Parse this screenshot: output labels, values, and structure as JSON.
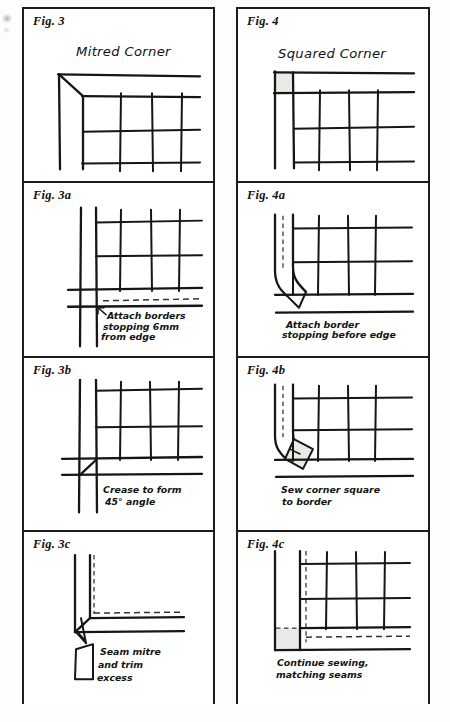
{
  "document": {
    "kind": "instructional-diagram-sheet",
    "subject": "Quilt border corner construction",
    "columns": 2,
    "panel_count": 8
  },
  "panels": [
    {
      "id": "fig-3",
      "figure_label": "Fig. 3",
      "heading": "Mitred Corner",
      "caption": "",
      "caption_lines": [],
      "column": "left",
      "row": 1,
      "has_grey_fill": false,
      "has_dashed_line": false,
      "description": "Border strips meeting at a 45 degree mitre seam with quilt grid"
    },
    {
      "id": "fig-4",
      "figure_label": "Fig. 4",
      "heading": "Squared Corner",
      "caption": "",
      "caption_lines": [],
      "column": "right",
      "row": 1,
      "has_grey_fill": true,
      "has_dashed_line": false,
      "description": "Border strips meeting at a square corner block with quilt grid"
    },
    {
      "id": "fig-3a",
      "figure_label": "Fig. 3a",
      "heading": "",
      "caption": "Attach borders stopping 6mm from edge",
      "caption_lines": [
        "Attach borders",
        "stopping 6mm",
        "from edge"
      ],
      "column": "left",
      "row": 2,
      "has_grey_fill": false,
      "has_dashed_line": true,
      "description": "Arrow points to stitch stop point 6mm in from the raw edge"
    },
    {
      "id": "fig-4a",
      "figure_label": "Fig. 4a",
      "heading": "",
      "caption": "Attach border stopping before edge",
      "caption_lines": [
        "Attach border",
        "stopping before edge"
      ],
      "column": "right",
      "row": 2,
      "has_grey_fill": false,
      "has_dashed_line": true,
      "description": "Border folded back at corner, stitching stops before the edge"
    },
    {
      "id": "fig-3b",
      "figure_label": "Fig. 3b",
      "heading": "",
      "caption": "Crease to form 45° angle",
      "caption_lines": [
        "Crease to form",
        "45° angle"
      ],
      "column": "left",
      "row": 3,
      "has_grey_fill": false,
      "has_dashed_line": false,
      "description": "Diagonal crease line formed at the corner at 45 degrees"
    },
    {
      "id": "fig-4b",
      "figure_label": "Fig. 4b",
      "heading": "",
      "caption": "Sew corner square to border",
      "caption_lines": [
        "Sew corner square",
        "to border"
      ],
      "column": "right",
      "row": 3,
      "has_grey_fill": true,
      "has_dashed_line": true,
      "description": "Grey corner square rotated and being sewn onto the folded border"
    },
    {
      "id": "fig-3c",
      "figure_label": "Fig. 3c",
      "heading": "",
      "caption": "Seam mitre and trim excess",
      "caption_lines": [
        "Seam mitre",
        "and trim",
        "excess"
      ],
      "column": "left",
      "row": 4,
      "has_grey_fill": false,
      "has_dashed_line": true,
      "description": "Finished mitre seam with trimmed excess fabric wedge below"
    },
    {
      "id": "fig-4c",
      "figure_label": "Fig. 4c",
      "heading": "",
      "caption": "Continue sewing, matching seams",
      "caption_lines": [
        "Continue sewing,",
        "matching seams"
      ],
      "column": "right",
      "row": 4,
      "has_grey_fill": true,
      "has_dashed_line": true,
      "description": "Corner square seamed in place, dashed stitch lines matching seams"
    }
  ],
  "style_tokens": {
    "ink": "#161616",
    "frame": "#1c1c1c",
    "paper": "#ffffff",
    "grey_fabric": "#e9e9e6",
    "dash_stroke": "#333333"
  }
}
